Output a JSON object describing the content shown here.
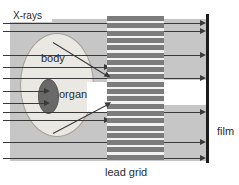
{
  "labels": {
    "xrays": "X-rays",
    "body": "body",
    "organ": "organ",
    "film": "film",
    "lead_grid": "lead grid"
  },
  "colors": {
    "page": "#ffffff",
    "beam_area": "#c6c6c6",
    "body_fill": "#eae8e3",
    "body_outline": "#a39f97",
    "organ_fill": "#696969",
    "organ_outline": "#565656",
    "grid_bar": "#7c7c7c",
    "grid_gap": "#f2f2f2",
    "ray": "#3a3a3a",
    "film": "#1c1c1c",
    "shadow": "#ffffff",
    "text": "#2b2b2b"
  },
  "diagram": {
    "beam_area": {
      "x": 10,
      "y": 19,
      "w": 197,
      "h": 142
    },
    "xrays_chip": {
      "x": 8,
      "y": 9,
      "w": 44,
      "h": 13
    },
    "body": {
      "x": 20,
      "y": 33,
      "w": 72,
      "h": 102
    },
    "organ": {
      "x": 38,
      "y": 79,
      "w": 19,
      "h": 33
    },
    "shadow_left": {
      "x": 87,
      "y": 82,
      "w": 21,
      "h": 30
    },
    "shadow_right": {
      "x": 164,
      "y": 80,
      "w": 42,
      "h": 25
    },
    "grid": {
      "x": 107,
      "y": 16,
      "w": 57,
      "h": 144,
      "bar_count": 20,
      "pitch": 7.3,
      "bar_h": 5
    },
    "film": {
      "x": 206,
      "y": 14,
      "w": 3,
      "h": 149
    },
    "rays": [
      {
        "x1": 3,
        "y": 23,
        "x2": 200,
        "end": "film"
      },
      {
        "x1": 3,
        "y": 31,
        "x2": 200,
        "end": "film"
      },
      {
        "x1": 3,
        "y": 55,
        "x2": 200,
        "end": "film"
      },
      {
        "x1": 3,
        "y": 67,
        "x2": 104,
        "end": "grid"
      },
      {
        "x1": 3,
        "y": 78,
        "x2": 200,
        "end": "film"
      },
      {
        "x1": 3,
        "y": 91,
        "x2": 44,
        "end": "organ"
      },
      {
        "x1": 3,
        "y": 103,
        "x2": 44,
        "end": "organ"
      },
      {
        "x1": 3,
        "y": 112,
        "x2": 200,
        "end": "film"
      },
      {
        "x1": 3,
        "y": 120,
        "x2": 104,
        "end": "grid"
      },
      {
        "x1": 3,
        "y": 142,
        "x2": 200,
        "end": "film"
      },
      {
        "x1": 3,
        "y": 158,
        "x2": 200,
        "end": "film"
      }
    ],
    "scatter_rays": [
      {
        "x1": 53,
        "y1": 42,
        "x2": 105,
        "y2": 74
      },
      {
        "x1": 53,
        "y1": 133,
        "x2": 106,
        "y2": 105
      }
    ],
    "label_positions": {
      "xrays": {
        "x": 13,
        "y": 10
      },
      "body": {
        "x": 41,
        "y": 52
      },
      "organ": {
        "x": 59,
        "y": 88
      },
      "film": {
        "x": 217,
        "y": 125
      },
      "lead_grid": {
        "x": 105,
        "y": 166
      }
    }
  }
}
